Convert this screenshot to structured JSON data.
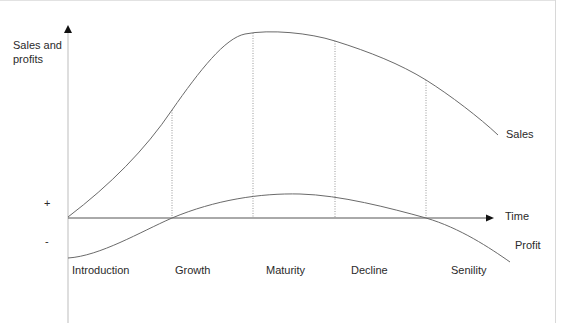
{
  "diagram": {
    "y_axis_label": "Sales and\nprofits",
    "y_axis_label_line1": "Sales and",
    "y_axis_label_line2": "profits",
    "x_axis_label": "Time",
    "plus_sign": "+",
    "minus_sign": "-",
    "curves": [
      {
        "name": "Sales",
        "label": "Sales",
        "color": "#666666"
      },
      {
        "name": "Profit",
        "label": "Profit",
        "color": "#666666"
      }
    ],
    "stages": [
      {
        "label": "Introduction"
      },
      {
        "label": "Growth"
      },
      {
        "label": "Maturity"
      },
      {
        "label": "Decline"
      },
      {
        "label": "Senility"
      }
    ],
    "stage_boundaries": [
      "Introduction|Growth",
      "Growth|Maturity",
      "Maturity|Decline",
      "Decline|Senility"
    ],
    "colors": {
      "axis": "#555555",
      "curve": "#666666",
      "divider": "#888888",
      "text": "#2a2a2a"
    }
  }
}
